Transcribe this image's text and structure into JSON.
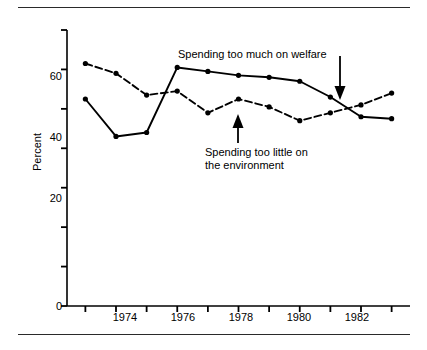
{
  "figure": {
    "background_color": "#ffffff",
    "ink_color": "#000000",
    "rule_color": "#2a2a2a"
  },
  "axes": {
    "y_title": "Percent",
    "y_ticks_labeled": [
      "0",
      "20",
      "40",
      "60"
    ],
    "y_tick_values": [
      0,
      20,
      40,
      60
    ],
    "y_minor_tick_values": [
      10,
      30,
      50,
      70
    ],
    "x_ticks_labeled": [
      "1974",
      "1976",
      "1978",
      "1980",
      "1982"
    ],
    "x_tick_values": [
      1973,
      1974,
      1975,
      1976,
      1977,
      1978,
      1979,
      1980,
      1981,
      1982,
      1983
    ]
  },
  "annotations": {
    "welfare": "Spending too much on welfare",
    "environment_line1": "Spending too little on",
    "environment_line2": "the environment"
  },
  "chart_data": {
    "type": "line",
    "title": "",
    "xlabel": "",
    "ylabel": "Percent",
    "xlim": [
      1972.4,
      1983.6
    ],
    "ylim": [
      0,
      70
    ],
    "grid": false,
    "legend": "annotations-with-arrows",
    "x": [
      1973,
      1974,
      1975,
      1976,
      1977,
      1978,
      1979,
      1980,
      1981,
      1982,
      1983
    ],
    "series": [
      {
        "name": "Spending too much on welfare",
        "style": "solid",
        "marker": "filled-circle",
        "values": [
          52.5,
          43.0,
          44.0,
          60.5,
          59.5,
          58.5,
          58.0,
          57.0,
          53.0,
          48.0,
          47.5
        ]
      },
      {
        "name": "Spending too little on the environment",
        "style": "dashed",
        "marker": "filled-circle",
        "values": [
          61.5,
          59.0,
          53.5,
          54.5,
          49.0,
          52.5,
          50.5,
          47.0,
          49.0,
          51.0,
          54.0
        ]
      }
    ]
  }
}
